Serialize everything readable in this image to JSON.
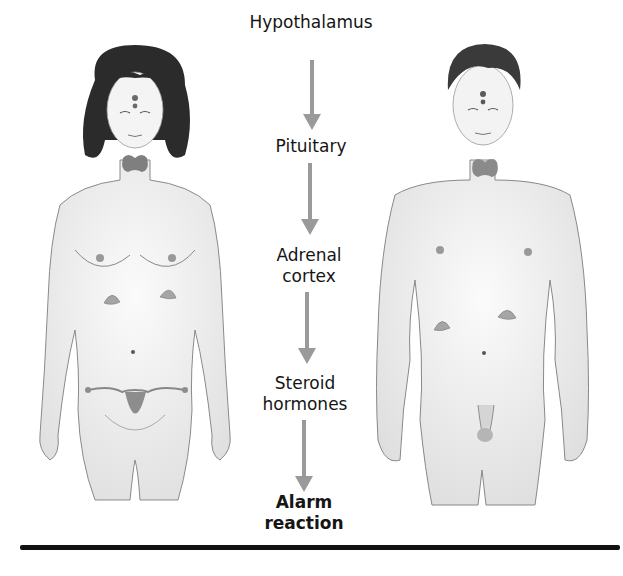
{
  "diagram": {
    "type": "flowchart-with-illustrations",
    "flow": [
      {
        "label": "Hypothalamus",
        "bold": false
      },
      {
        "label": "Pituitary",
        "bold": false
      },
      {
        "label": "Adrenal\ncortex",
        "line1": "Adrenal",
        "line2": "cortex",
        "bold": false
      },
      {
        "label": "Steroid\nhormones",
        "line1": "Steroid",
        "line2": "hormones",
        "bold": false
      },
      {
        "label": "Alarm\nreaction",
        "line1": "Alarm",
        "line2": "reaction",
        "bold": true
      }
    ],
    "arrows": 4,
    "arrow_color": "#9a9a9a",
    "illustrations": [
      {
        "name": "female-figure",
        "glands": [
          "hypothalamus/pituitary",
          "thyroid",
          "adrenal glands",
          "ovaries/uterus"
        ]
      },
      {
        "name": "male-figure",
        "glands": [
          "hypothalamus/pituitary",
          "thyroid",
          "adrenal glands",
          "testes"
        ]
      }
    ],
    "gland_color": "#8a8a8a",
    "skin_color": "#f2f2f2",
    "outline_color": "#777777",
    "rule_color": "#111111"
  }
}
